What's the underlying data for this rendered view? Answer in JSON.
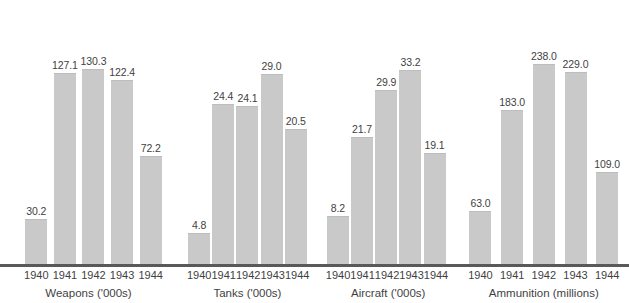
{
  "chart_data": {
    "type": "bar",
    "title": "",
    "subtitle": "",
    "xlabel": "",
    "ylabel": "",
    "grid": false,
    "legend": "none",
    "note": "Four separate bar panels, each with its own vertical scale; value labels printed above every bar.",
    "categories": [
      "1940",
      "1941",
      "1942",
      "1943",
      "1944"
    ],
    "panels": [
      {
        "title": "Weapons ('000s)",
        "unit": "thousands",
        "ylim": [
          0,
          140
        ],
        "categories": [
          "1940",
          "1941",
          "1942",
          "1943",
          "1944"
        ],
        "values": [
          30.2,
          127.1,
          130.3,
          122.4,
          72.2
        ],
        "labels": [
          "30.2",
          "127.1",
          "130.3",
          "122.4",
          "72.2"
        ]
      },
      {
        "title": "Tanks ('000s)",
        "unit": "thousands",
        "ylim": [
          0,
          32
        ],
        "categories": [
          "1940",
          "1941",
          "1942",
          "1943",
          "1944"
        ],
        "values": [
          4.8,
          24.4,
          24.1,
          29.0,
          20.5
        ],
        "labels": [
          "4.8",
          "24.4",
          "24.1",
          "29.0",
          "20.5"
        ]
      },
      {
        "title": "Aircraft ('000s)",
        "unit": "thousands",
        "ylim": [
          0,
          36
        ],
        "categories": [
          "1940",
          "1941",
          "1942",
          "1943",
          "1944"
        ],
        "values": [
          8.2,
          21.7,
          29.9,
          33.2,
          19.1
        ],
        "labels": [
          "8.2",
          "21.7",
          "29.9",
          "33.2",
          "19.1"
        ]
      },
      {
        "title": "Ammunition (millions)",
        "unit": "millions",
        "ylim": [
          0,
          250
        ],
        "categories": [
          "1940",
          "1941",
          "1942",
          "1943",
          "1944"
        ],
        "values": [
          63.0,
          183.0,
          238.0,
          229.0,
          109.0
        ],
        "labels": [
          "63.0",
          "183.0",
          "238.0",
          "229.0",
          "109.0"
        ]
      }
    ]
  },
  "style": {
    "bar_color": "#c9c9c9",
    "axis_color": "#595959",
    "text_color": "#3f3f3f",
    "background": "#ffffff"
  }
}
